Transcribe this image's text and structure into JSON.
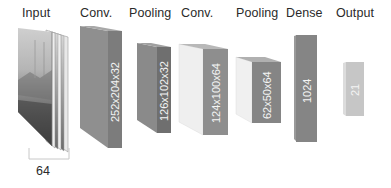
{
  "diagram": {
    "type": "cnn-architecture",
    "layers": [
      {
        "id": "input",
        "label": "Input",
        "dims": "",
        "depth_annotation": "64"
      },
      {
        "id": "conv1",
        "label": "Conv.",
        "dims": "252x204x32"
      },
      {
        "id": "pool1",
        "label": "Pooling",
        "dims": "126x102x32"
      },
      {
        "id": "conv2",
        "label": "Conv.",
        "dims": "124x100x64"
      },
      {
        "id": "pool2",
        "label": "Pooling",
        "dims": "62x50x64"
      },
      {
        "id": "dense",
        "label": "Dense",
        "dims": "1024"
      },
      {
        "id": "output",
        "label": "Output",
        "dims": "21"
      }
    ],
    "input_stack_depth_label": "64",
    "colors": {
      "background": "#ffffff",
      "label_text": "#2a2a2a",
      "block_dark_front": "#7d7d7d",
      "block_dark_side": "#999999",
      "block_light_side": "#ececec",
      "block_light_front": "#8a8a8a",
      "dense_front": "#888888",
      "output_front": "#c8c8c8",
      "dim_text": "#f4f4f4"
    }
  }
}
